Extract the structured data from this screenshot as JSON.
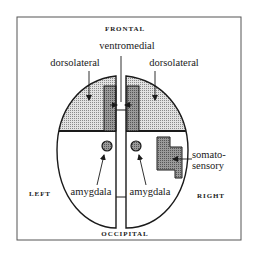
{
  "diagram": {
    "orientation_labels": {
      "top": "FRONTAL",
      "bottom": "OCCIPITAL",
      "left": "LEFT",
      "right": "RIGHT"
    },
    "region_labels": {
      "ventromedial": "ventromedial",
      "dorsolateral_left": "dorsolateral",
      "dorsolateral_right": "dorsolateral",
      "amygdala_left": "amygdala",
      "amygdala_right": "amygdala",
      "somatosensory_line1": "somato-",
      "somatosensory_line2": "sensory"
    },
    "colors": {
      "outline": "#1a1a1a",
      "light_stipple": "#c9c9c9",
      "dark_stipple": "#8e8e8e",
      "background": "#ffffff"
    }
  }
}
